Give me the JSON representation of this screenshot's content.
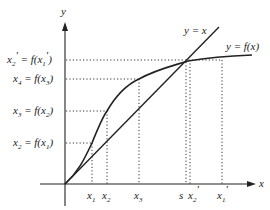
{
  "diagram": {
    "type": "fixed-point-iteration",
    "axes": {
      "x_label": "x",
      "y_label": "y"
    },
    "curves": [
      {
        "name": "identity",
        "label": "y = x"
      },
      {
        "name": "function",
        "label": "y = f(x)"
      }
    ],
    "y_levels": [
      {
        "id": "x2p",
        "lhs": "x",
        "lhs_sub": "2",
        "lhs_prime": "'",
        "rhs_arg": "x",
        "rhs_sub": "1",
        "rhs_prime": "'"
      },
      {
        "id": "x4",
        "lhs": "x",
        "lhs_sub": "4",
        "rhs_arg": "x",
        "rhs_sub": "3"
      },
      {
        "id": "x3",
        "lhs": "x",
        "lhs_sub": "3",
        "rhs_arg": "x",
        "rhs_sub": "2"
      },
      {
        "id": "x2",
        "lhs": "x",
        "lhs_sub": "2",
        "rhs_arg": "x",
        "rhs_sub": "1"
      }
    ],
    "x_ticks": [
      {
        "id": "x1",
        "base": "x",
        "sub": "1"
      },
      {
        "id": "x2",
        "base": "x",
        "sub": "2"
      },
      {
        "id": "x3",
        "base": "x",
        "sub": "3"
      },
      {
        "id": "s",
        "base": "s"
      },
      {
        "id": "x2p",
        "base": "x",
        "sub": "2",
        "prime": "'"
      },
      {
        "id": "x1p",
        "base": "x",
        "sub": "1",
        "prime": "'"
      }
    ],
    "colors": {
      "ink": "#222222",
      "background": "#ffffff"
    }
  }
}
